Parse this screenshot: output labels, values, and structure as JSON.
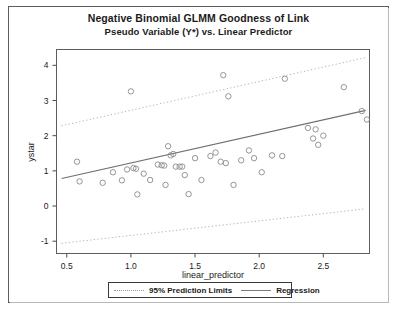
{
  "figure": {
    "title_line1": "Negative Binomial GLMM Goodness of Link",
    "title_line2": "Pseudo Variable (Y*) vs. Linear Predictor"
  },
  "legend": {
    "prediction_label": "95% Prediction Limits",
    "regression_label": "Regression"
  },
  "colors": {
    "point_stroke": "#8a8a8a",
    "regression_line": "#6f6f6f",
    "prediction_line": "#b2b2b2",
    "axis": "#4a4a4a",
    "frame": "#5d5d5d",
    "text": "#1b1b1b"
  },
  "chart_data": {
    "type": "scatter",
    "xlabel": "linear_predictor",
    "ylabel": "ystar",
    "xlim": [
      0.42,
      2.86
    ],
    "ylim": [
      -1.35,
      4.45
    ],
    "xticks": [
      0.5,
      1.0,
      1.5,
      2.0,
      2.5
    ],
    "xtick_labels": [
      "0.5",
      "1.0",
      "1.5",
      "2.0",
      "2.5"
    ],
    "yticks": [
      -1,
      0,
      1,
      2,
      3,
      4
    ],
    "ytick_labels": [
      "-1",
      "0",
      "1",
      "2",
      "3",
      "4"
    ],
    "grid": false,
    "legend_position": "bottom",
    "points": [
      {
        "x": 0.58,
        "y": 1.26
      },
      {
        "x": 0.6,
        "y": 0.7
      },
      {
        "x": 0.78,
        "y": 0.66
      },
      {
        "x": 0.86,
        "y": 0.96
      },
      {
        "x": 0.93,
        "y": 0.73
      },
      {
        "x": 0.97,
        "y": 1.04
      },
      {
        "x": 1.0,
        "y": 3.26
      },
      {
        "x": 1.02,
        "y": 1.08
      },
      {
        "x": 1.04,
        "y": 1.06
      },
      {
        "x": 1.05,
        "y": 0.33
      },
      {
        "x": 1.1,
        "y": 0.92
      },
      {
        "x": 1.15,
        "y": 0.74
      },
      {
        "x": 1.21,
        "y": 1.18
      },
      {
        "x": 1.24,
        "y": 1.16
      },
      {
        "x": 1.26,
        "y": 1.15
      },
      {
        "x": 1.27,
        "y": 0.6
      },
      {
        "x": 1.29,
        "y": 1.7
      },
      {
        "x": 1.31,
        "y": 1.44
      },
      {
        "x": 1.33,
        "y": 1.48
      },
      {
        "x": 1.35,
        "y": 1.12
      },
      {
        "x": 1.38,
        "y": 1.12
      },
      {
        "x": 1.4,
        "y": 1.12
      },
      {
        "x": 1.42,
        "y": 0.88
      },
      {
        "x": 1.45,
        "y": 0.34
      },
      {
        "x": 1.5,
        "y": 1.36
      },
      {
        "x": 1.55,
        "y": 0.74
      },
      {
        "x": 1.62,
        "y": 1.42
      },
      {
        "x": 1.66,
        "y": 1.52
      },
      {
        "x": 1.7,
        "y": 1.26
      },
      {
        "x": 1.72,
        "y": 3.72
      },
      {
        "x": 1.74,
        "y": 1.22
      },
      {
        "x": 1.76,
        "y": 3.12
      },
      {
        "x": 1.8,
        "y": 0.6
      },
      {
        "x": 1.86,
        "y": 1.3
      },
      {
        "x": 1.92,
        "y": 1.58
      },
      {
        "x": 1.96,
        "y": 1.36
      },
      {
        "x": 2.02,
        "y": 0.96
      },
      {
        "x": 2.1,
        "y": 1.44
      },
      {
        "x": 2.18,
        "y": 1.42
      },
      {
        "x": 2.2,
        "y": 3.62
      },
      {
        "x": 2.38,
        "y": 2.22
      },
      {
        "x": 2.42,
        "y": 1.92
      },
      {
        "x": 2.44,
        "y": 2.18
      },
      {
        "x": 2.46,
        "y": 1.74
      },
      {
        "x": 2.5,
        "y": 2.0
      },
      {
        "x": 2.66,
        "y": 3.38
      },
      {
        "x": 2.8,
        "y": 2.7
      },
      {
        "x": 2.84,
        "y": 2.46
      }
    ],
    "series": [
      {
        "name": "Regression",
        "type": "line",
        "style": "solid",
        "x": [
          0.46,
          2.83
        ],
        "y": [
          0.78,
          2.72
        ]
      },
      {
        "name": "95% Prediction Limits Upper",
        "type": "line",
        "style": "dotted",
        "x": [
          0.46,
          2.83
        ],
        "y": [
          2.28,
          4.22
        ]
      },
      {
        "name": "95% Prediction Limits Lower",
        "type": "line",
        "style": "dotted",
        "x": [
          0.46,
          2.83
        ],
        "y": [
          -1.06,
          -0.08
        ]
      }
    ]
  }
}
